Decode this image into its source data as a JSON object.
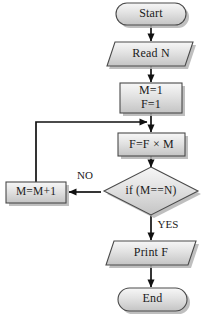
{
  "diagram": {
    "background_color": "#ffffff",
    "shape_fill_top": "#f2f2f2",
    "shape_fill_bottom": "#c9c9c9",
    "shape_stroke": "#4a4a4a",
    "line_color": "#111111",
    "shadow_color": "#b4b4b4"
  },
  "nodes": {
    "start": {
      "label": "Start",
      "shape": "stadium"
    },
    "read": {
      "label": "Read  N",
      "shape": "parallelogram"
    },
    "init_line1": {
      "label": "M=1"
    },
    "init_line2": {
      "label": "F=1"
    },
    "compute": {
      "label": "F=F × M",
      "shape": "rectangle"
    },
    "decision": {
      "label": "if (M==N)",
      "shape": "diamond"
    },
    "increment": {
      "label": "M=M+1",
      "shape": "rectangle"
    },
    "print": {
      "label": "Print  F",
      "shape": "parallelogram"
    },
    "end": {
      "label": "End",
      "shape": "stadium"
    }
  },
  "edge_labels": {
    "no": "NO",
    "yes": "YES"
  }
}
